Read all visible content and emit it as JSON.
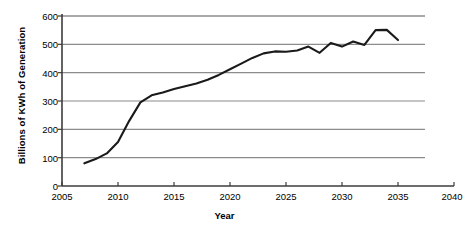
{
  "chart_data": {
    "type": "line",
    "title": "",
    "xlabel": "Year",
    "ylabel": "Billions of KWh of Generation",
    "xlim": [
      2005,
      2040
    ],
    "ylim": [
      0,
      600
    ],
    "xticks": [
      2005,
      2010,
      2015,
      2020,
      2025,
      2030,
      2035,
      2040
    ],
    "yticks": [
      0,
      100,
      200,
      300,
      400,
      500,
      600
    ],
    "grid": "horizontal",
    "legend": "none",
    "series": [
      {
        "name": "Generation",
        "color": "#1a1a1a",
        "x": [
          2007,
          2008,
          2009,
          2010,
          2011,
          2012,
          2013,
          2014,
          2015,
          2016,
          2017,
          2018,
          2019,
          2020,
          2021,
          2022,
          2023,
          2024,
          2025,
          2026,
          2027,
          2028,
          2029,
          2030,
          2031,
          2032,
          2033,
          2034,
          2035
        ],
        "values": [
          80,
          95,
          115,
          155,
          230,
          295,
          320,
          330,
          342,
          352,
          362,
          375,
          392,
          412,
          432,
          452,
          468,
          475,
          474,
          478,
          492,
          470,
          505,
          492,
          510,
          498,
          550,
          551,
          515
        ]
      }
    ]
  },
  "axis": {
    "x_tick_labels": [
      "2005",
      "2010",
      "2015",
      "2020",
      "2025",
      "2030",
      "2035",
      "2040"
    ],
    "y_tick_labels": [
      "0",
      "100",
      "200",
      "300",
      "400",
      "500",
      "600"
    ]
  },
  "labels": {
    "y_axis_title": "Billions of KWh of Generation",
    "x_axis_title": "Year"
  },
  "colors": {
    "line": "#1a1a1a",
    "grid": "#8c8c8c",
    "axis": "#3d3d3d",
    "background": "#ffffff",
    "text": "#000000"
  }
}
